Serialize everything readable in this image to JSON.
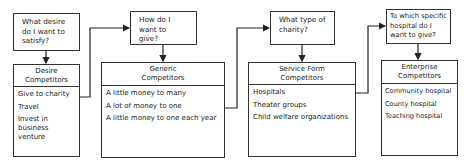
{
  "stages": [
    {
      "question": "What desire do I want to satisfy?",
      "title": "Desire Competitors",
      "items": [
        "Give to charity",
        "Travel",
        "Invest in\n   business\n   venture"
      ]
    },
    {
      "question": "How do I want to give?",
      "title": "Generic Competitors",
      "items": [
        "A little money to many",
        "A lot of money to one",
        "A little money to one each year"
      ]
    },
    {
      "question": "What type of charity?",
      "title": "Service Form Competitors",
      "items": [
        "Hospitals",
        "Theater groups",
        "Child welfare organizations"
      ]
    },
    {
      "question": "To which specific hospital do I want to give?",
      "title": "Enterprise Competitors",
      "items": [
        "Community hospital",
        "County hospital",
        "Teaching hospital"
      ]
    }
  ]
}
